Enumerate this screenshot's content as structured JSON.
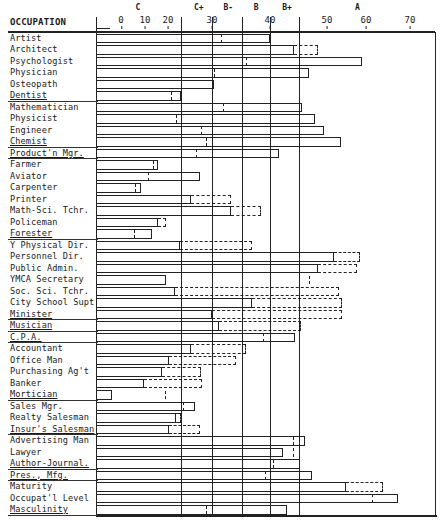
{
  "chart_data": {
    "type": "bar",
    "orientation": "horizontal",
    "title": "",
    "column_header": "OCCUPATION",
    "xlabel": "",
    "ylabel": "OCCUPATION",
    "xlim": [
      -10,
      75
    ],
    "x_ticks": [
      0,
      10,
      20,
      30,
      40,
      50,
      60,
      70
    ],
    "grade_labels": [
      {
        "label": "C",
        "at": 7
      },
      {
        "label": "C+",
        "at": 27
      },
      {
        "label": "B-",
        "at": 32.8
      },
      {
        "label": "B",
        "at": 37.6
      },
      {
        "label": "B+",
        "at": 43.0
      },
      {
        "label": "A",
        "at": 57.8
      }
    ],
    "grade_boundaries": [
      23.0,
      30.0,
      35.2,
      40.0,
      45.0
    ],
    "legend": [
      {
        "style": "solid",
        "meaning": "primary score bar"
      },
      {
        "style": "dashed",
        "meaning": "secondary score (dashed marker or extension)"
      }
    ],
    "series": [
      {
        "name": "solid",
        "values": [
          40.0,
          44.2,
          59.0,
          46.8,
          30.3,
          22.9,
          45.6,
          47.9,
          49.5,
          53.6,
          41.6,
          15.7,
          27.3,
          8.3,
          25.2,
          33.3,
          15.7,
          13.0,
          22.7,
          51.8,
          48.4,
          19.1,
          21.6,
          36.9,
          30.0,
          31.2,
          44.4,
          25.2,
          20.2,
          17.4,
          9.6,
          -3.8,
          26.1,
          21.8,
          20.2,
          46.1,
          42.3,
          45.3,
          47.4,
          54.9,
          67.3,
          43.0
        ]
      },
      {
        "name": "dashed",
        "values": [
          31.6,
          48.4,
          35.9,
          30.3,
          30.2,
          20.7,
          31.9,
          21.8,
          27.5,
          28.6,
          26.4,
          13.5,
          11.3,
          5.8,
          33.3,
          38.4,
          19.1,
          5.4,
          36.9,
          58.5,
          57.7,
          46.8,
          53.1,
          53.8,
          53.8,
          45.4,
          38.8,
          35.9,
          34.1,
          27.5,
          27.7,
          18.7,
          23.4,
          22.9,
          27.3,
          44.0,
          44.0,
          40.5,
          39.1,
          63.9,
          61.4,
          28.6
        ]
      }
    ],
    "categories": [
      "Artist",
      "Architect",
      "Psychologist",
      "Physician",
      "Osteopath",
      "Dentist",
      "Mathematician",
      "Physicist",
      "Engineer",
      "Chemist",
      "Product'n Mgr.",
      "Farmer",
      "Aviator",
      "Carpenter",
      "Printer",
      "Math-Sci. Tchr.",
      "Policeman",
      "Forester",
      "Y Physical Dir.",
      "Personnel Dir.",
      "Public Admin.",
      "YMCA Secretary",
      "Soc. Sci. Tchr.",
      "City School Supt",
      "Minister",
      "Musician",
      "C.P.A.",
      "Accountant",
      "Office Man",
      "Purchasing Ag't",
      "Banker",
      "Mortician",
      "Sales Mgr.",
      "Realty Salesman",
      "Insur's Salesman",
      "Advertising Man",
      "Lawyer",
      "Author-Journal.",
      "Pres., Mfg.",
      "Maturity",
      "Occupat'l Level",
      "Masculinity"
    ],
    "rows": [
      {
        "label": "Artist",
        "solid": 40.0,
        "dashed": 31.6,
        "dash_type": "marker",
        "underline": false
      },
      {
        "label": "Architect",
        "solid": 44.2,
        "dashed": 48.4,
        "dash_type": "ext",
        "underline": false
      },
      {
        "label": "Psychologist",
        "solid": 59.0,
        "dashed": 35.9,
        "dash_type": "marker",
        "underline": false
      },
      {
        "label": "Physician",
        "solid": 46.8,
        "dashed": 30.3,
        "dash_type": "marker",
        "underline": false
      },
      {
        "label": "Osteopath",
        "solid": 30.3,
        "dashed": 30.2,
        "dash_type": "marker",
        "underline": false
      },
      {
        "label": "Dentist",
        "solid": 22.9,
        "dashed": 20.7,
        "dash_type": "marker",
        "underline": true
      },
      {
        "label": "Mathematician",
        "solid": 45.6,
        "dashed": 31.9,
        "dash_type": "marker",
        "underline": false
      },
      {
        "label": "Physicist",
        "solid": 47.9,
        "dashed": 21.8,
        "dash_type": "marker",
        "underline": false
      },
      {
        "label": "Engineer",
        "solid": 49.5,
        "dashed": 27.5,
        "dash_type": "marker",
        "underline": false
      },
      {
        "label": "Chemist",
        "solid": 53.6,
        "dashed": 28.6,
        "dash_type": "marker",
        "underline": true
      },
      {
        "label": "Product'n Mgr.",
        "solid": 41.6,
        "dashed": 26.4,
        "dash_type": "marker",
        "underline": true
      },
      {
        "label": "Farmer",
        "solid": 15.7,
        "dashed": 13.5,
        "dash_type": "marker",
        "underline": false
      },
      {
        "label": "Aviator",
        "solid": 27.3,
        "dashed": 11.3,
        "dash_type": "marker",
        "underline": false
      },
      {
        "label": "Carpenter",
        "solid": 8.3,
        "dashed": 5.8,
        "dash_type": "marker",
        "underline": false
      },
      {
        "label": "Printer",
        "solid": 25.2,
        "dashed": 33.3,
        "dash_type": "ext",
        "underline": false
      },
      {
        "label": "Math-Sci. Tchr.",
        "solid": 33.3,
        "dashed": 38.4,
        "dash_type": "ext",
        "underline": false
      },
      {
        "label": "Policeman",
        "solid": 15.7,
        "dashed": 19.1,
        "dash_type": "ext",
        "underline": false
      },
      {
        "label": "Forester",
        "solid": 13.0,
        "dashed": 5.4,
        "dash_type": "marker",
        "underline": true
      },
      {
        "label": "Y Physical Dir.",
        "solid": 22.7,
        "dashed": 36.9,
        "dash_type": "ext",
        "underline": false
      },
      {
        "label": "Personnel Dir.",
        "solid": 51.8,
        "dashed": 58.5,
        "dash_type": "ext",
        "underline": false
      },
      {
        "label": "Public Admin.",
        "solid": 48.4,
        "dashed": 57.7,
        "dash_type": "ext",
        "underline": false
      },
      {
        "label": "YMCA Secretary",
        "solid": 19.1,
        "dashed": 46.8,
        "dash_type": "marker",
        "underline": false
      },
      {
        "label": "Soc. Sci. Tchr.",
        "solid": 21.6,
        "dashed": 53.1,
        "dash_type": "ext",
        "underline": false
      },
      {
        "label": "City School Supt",
        "solid": 36.9,
        "dashed": 53.8,
        "dash_type": "ext",
        "underline": false
      },
      {
        "label": "Minister",
        "solid": 30.0,
        "dashed": 53.8,
        "dash_type": "ext",
        "underline": true
      },
      {
        "label": "Musician",
        "solid": 31.2,
        "dashed": 45.4,
        "dash_type": "ext",
        "underline": true
      },
      {
        "label": "C.P.A.",
        "solid": 44.4,
        "dashed": 38.8,
        "dash_type": "marker",
        "underline": true
      },
      {
        "label": "Accountant",
        "solid": 25.2,
        "dashed": 35.9,
        "dash_type": "ext",
        "underline": false
      },
      {
        "label": "Office Man",
        "solid": 20.2,
        "dashed": 34.1,
        "dash_type": "ext",
        "underline": false
      },
      {
        "label": "Purchasing Ag't",
        "solid": 17.4,
        "dashed": 27.5,
        "dash_type": "ext",
        "underline": false
      },
      {
        "label": "Banker",
        "solid": 9.6,
        "dashed": 27.7,
        "dash_type": "ext",
        "underline": false
      },
      {
        "label": "Mortician",
        "solid": -3.8,
        "dashed": 18.7,
        "dash_type": "marker",
        "underline": true
      },
      {
        "label": "Sales Mgr.",
        "solid": 26.1,
        "dashed": 23.4,
        "dash_type": "marker",
        "underline": false
      },
      {
        "label": "Realty Salesman",
        "solid": 21.8,
        "dashed": 22.9,
        "dash_type": "ext",
        "underline": false
      },
      {
        "label": "Insur's Salesman",
        "solid": 20.2,
        "dashed": 27.3,
        "dash_type": "ext",
        "underline": true
      },
      {
        "label": "Advertising Man",
        "solid": 46.1,
        "dashed": 44.0,
        "dash_type": "marker",
        "underline": false
      },
      {
        "label": "Lawyer",
        "solid": 42.3,
        "dashed": 44.0,
        "dash_type": "marker",
        "underline": false
      },
      {
        "label": "Author-Journal.",
        "solid": 45.3,
        "dashed": 40.5,
        "dash_type": "marker",
        "underline": true
      },
      {
        "label": "Pres., Mfg.",
        "solid": 47.4,
        "dashed": 39.1,
        "dash_type": "marker",
        "underline": true
      },
      {
        "label": "Maturity",
        "solid": 54.9,
        "dashed": 63.9,
        "dash_type": "ext",
        "underline": false
      },
      {
        "label": "Occupat'l Level",
        "solid": 67.3,
        "dashed": 61.4,
        "dash_type": "marker",
        "underline": false
      },
      {
        "label": "Masculinity",
        "solid": 43.0,
        "dashed": 28.6,
        "dash_type": "marker",
        "underline": true
      }
    ]
  }
}
